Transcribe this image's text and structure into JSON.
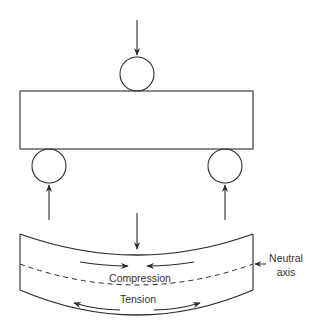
{
  "diagram": {
    "labels": {
      "compression": "Compression",
      "tension": "Tension",
      "neutral_axis_line1": "Neutral",
      "neutral_axis_line2": "axis"
    },
    "colors": {
      "stroke": "#2a2a2a",
      "text": "#333333",
      "background": "#ffffff"
    }
  }
}
